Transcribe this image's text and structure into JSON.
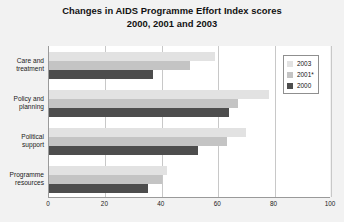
{
  "chart_data": {
    "type": "bar",
    "orientation": "horizontal",
    "title": "Changes in AIDS Programme Effort Index scores 2000, 2001 and 2003",
    "title_line1": "Changes in AIDS Programme Effort Index scores",
    "title_line2": "2000, 2001 and 2003",
    "xlabel": "",
    "ylabel": "",
    "xlim": [
      0,
      100
    ],
    "xticks": [
      "0",
      "20",
      "40",
      "60",
      "80",
      "100"
    ],
    "xtick_values": [
      0,
      20,
      40,
      60,
      80,
      100
    ],
    "grid": "vertical",
    "legend_position": "right",
    "categories": [
      "Care and treatment",
      "Policy and planning",
      "Political support",
      "Programme resources"
    ],
    "categories_wrapped": [
      [
        "Care and",
        "treatment"
      ],
      [
        "Policy and",
        "planning"
      ],
      [
        "Political",
        "support"
      ],
      [
        "Programme",
        "resources"
      ]
    ],
    "series": [
      {
        "name": "2003",
        "color": "#e2e2e2",
        "values": [
          59,
          78,
          70,
          42
        ]
      },
      {
        "name": "2001*",
        "color": "#c4c4c4",
        "values": [
          50,
          67,
          63,
          40
        ]
      },
      {
        "name": "2000",
        "color": "#4d4d4d",
        "values": [
          37,
          64,
          53,
          35
        ]
      }
    ]
  },
  "legend": {
    "items": [
      {
        "label": "2003"
      },
      {
        "label": "2001*"
      },
      {
        "label": "2000"
      }
    ]
  },
  "colors": {
    "background": "#f2f2f2",
    "plot_background": "#ffffff",
    "axis": "#9a9a9a",
    "gridline": "#c8c8c8",
    "text": "#111111",
    "series_2003": "#e2e2e2",
    "series_2001": "#c4c4c4",
    "series_2000": "#4d4d4d"
  }
}
